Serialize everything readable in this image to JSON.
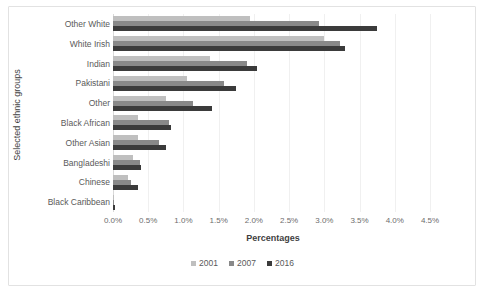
{
  "chart_data": {
    "type": "bar",
    "orientation": "horizontal",
    "title": "",
    "xlabel": "Percentages",
    "ylabel": "Selected ethnic groups",
    "xlim": [
      0,
      4.5
    ],
    "xtick_labels": [
      "0.0%",
      "0.5%",
      "1.0%",
      "1.5%",
      "2.0%",
      "2.5%",
      "3.0%",
      "3.5%",
      "4.0%",
      "4.5%"
    ],
    "xtick_values": [
      0,
      0.5,
      1.0,
      1.5,
      2.0,
      2.5,
      3.0,
      3.5,
      4.0,
      4.5
    ],
    "grid": true,
    "legend_position": "bottom",
    "categories": [
      "Other White",
      "White Irish",
      "Indian",
      "Pakistani",
      "Other",
      "Black African",
      "Other Asian",
      "Bangladeshi",
      "Chinese",
      "Black Caribbean"
    ],
    "series": [
      {
        "name": "2001",
        "color": "#bfbfbf",
        "values": [
          1.95,
          3.0,
          1.38,
          1.05,
          0.75,
          0.35,
          0.35,
          0.28,
          0.22,
          0.02
        ]
      },
      {
        "name": "2007",
        "color": "#898989",
        "values": [
          2.93,
          3.22,
          1.9,
          1.58,
          1.13,
          0.8,
          0.65,
          0.38,
          0.26,
          0.02
        ]
      },
      {
        "name": "2016",
        "color": "#3b3b3b",
        "values": [
          3.75,
          3.3,
          2.05,
          1.75,
          1.4,
          0.82,
          0.75,
          0.4,
          0.35,
          0.03
        ]
      }
    ]
  },
  "legend": {
    "items": [
      {
        "label": "2001"
      },
      {
        "label": "2007"
      },
      {
        "label": "2016"
      }
    ]
  }
}
